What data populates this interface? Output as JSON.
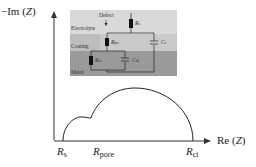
{
  "axes": {
    "y_label": "−Im (",
    "y_var": "Z",
    "y_close": ")",
    "x_label": "Re (",
    "x_var": "Z",
    "x_close": ")"
  },
  "x_ticks": [
    {
      "main": "R",
      "sub": "s"
    },
    {
      "main": "R",
      "sub": "pore"
    },
    {
      "main": "R",
      "sub": "ct"
    }
  ],
  "inset": {
    "layers": [
      "Electrolyte",
      "Coating",
      "Metal"
    ],
    "defect_label": "Defect",
    "components": [
      {
        "main": "R",
        "sub": "s"
      },
      {
        "main": "R",
        "sub": "po"
      },
      {
        "main": "C",
        "sub": "c"
      },
      {
        "main": "R",
        "sub": "ct"
      },
      {
        "main": "C",
        "sub": "dl"
      }
    ],
    "colors": {
      "electrolyte": "#d9d9d9",
      "coating": "#bdbdbd",
      "metal": "#9a9a9a"
    }
  }
}
